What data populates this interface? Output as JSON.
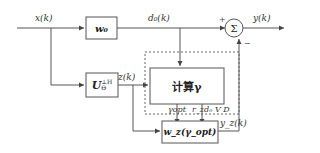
{
  "signals": {
    "x": "x(k)",
    "d0": "d₀(k)",
    "y": "y(k)",
    "z": "z(k)",
    "yz": "y_z(k)"
  },
  "blocks": {
    "w0": "w₀",
    "u_perp": "U",
    "u_perp_sup": "⊥H",
    "u_perp_sub": "Θ",
    "compute": "计算γ",
    "wz": "w_z(γ_opt)"
  },
  "sum_node": {
    "symbol": "Σ",
    "plus": "+",
    "minus": "−"
  },
  "branch_labels": {
    "gamma_opt": "γopt",
    "r_vd": "r_zd₀ V D"
  },
  "colors": {
    "line": "#555555",
    "box_border": "#555555",
    "dashed": "#666666"
  }
}
